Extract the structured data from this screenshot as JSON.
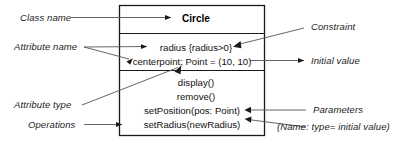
{
  "diagram": {
    "kind": "uml-class-diagram",
    "colors": {
      "background": "#ffffff",
      "box_border": "#1a1a1a",
      "leader_line": "#555555",
      "text": "#111111",
      "label_text": "#1c1c1c"
    },
    "class_box": {
      "name": "Circle",
      "attributes": [
        {
          "text": "radius {radius>0}"
        },
        {
          "text": "centerpoint; Point = (10, 10)"
        }
      ],
      "operations": [
        {
          "text": "display()"
        },
        {
          "text": "remove()"
        },
        {
          "text": "setPosition(pos: Point)"
        },
        {
          "text": "setRadius(newRadius)"
        }
      ]
    },
    "annotations": {
      "class_name": "Class name",
      "attribute_name": "Attribute name",
      "attribute_type": "Attribute type",
      "operations": "Operations",
      "constraint": "Constraint",
      "initial_value": "Initial value",
      "parameters": "Parameters",
      "parameters_note": "(Name: type= initial value)"
    }
  }
}
